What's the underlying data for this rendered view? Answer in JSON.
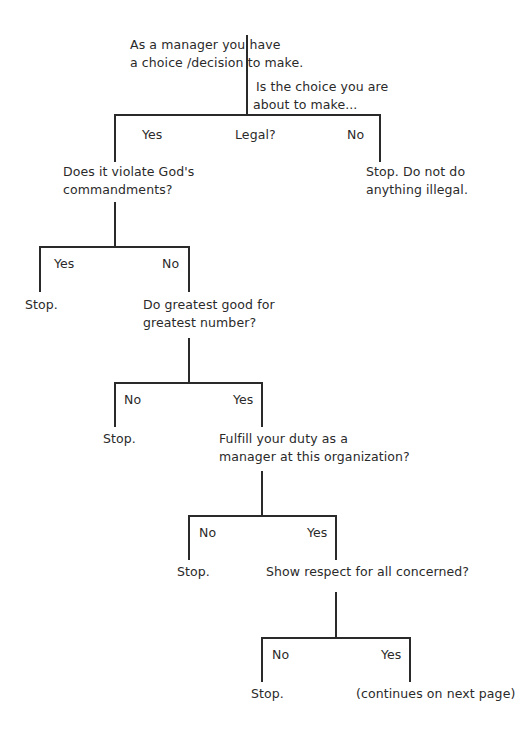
{
  "diagram": {
    "type": "decision-tree",
    "line_color": "#2a2a2a",
    "root": {
      "intro_line1": "As a manager you have",
      "intro_line2": "a choice /decision to make.",
      "question_line1": "Is the choice you are",
      "question_line2": "about to make..."
    },
    "level1": {
      "yes_label": "Yes",
      "question": "Legal?",
      "no_label": "No",
      "no_outcome_line1": "Stop. Do not do",
      "no_outcome_line2": "anything illegal."
    },
    "level2": {
      "question_line1": "Does it violate God's",
      "question_line2": "commandments?",
      "yes_label": "Yes",
      "no_label": "No",
      "yes_outcome": "Stop."
    },
    "level3": {
      "question_line1": "Do greatest good for",
      "question_line2": "greatest number?",
      "no_label": "No",
      "yes_label": "Yes",
      "no_outcome": "Stop."
    },
    "level4": {
      "question_line1": "Fulfill your duty as a",
      "question_line2": "manager at this organization?",
      "no_label": "No",
      "yes_label": "Yes",
      "no_outcome": "Stop."
    },
    "level5": {
      "question": "Show respect for all concerned?",
      "no_label": "No",
      "yes_label": "Yes",
      "no_outcome": "Stop.",
      "yes_outcome": "(continues on next page)"
    }
  }
}
